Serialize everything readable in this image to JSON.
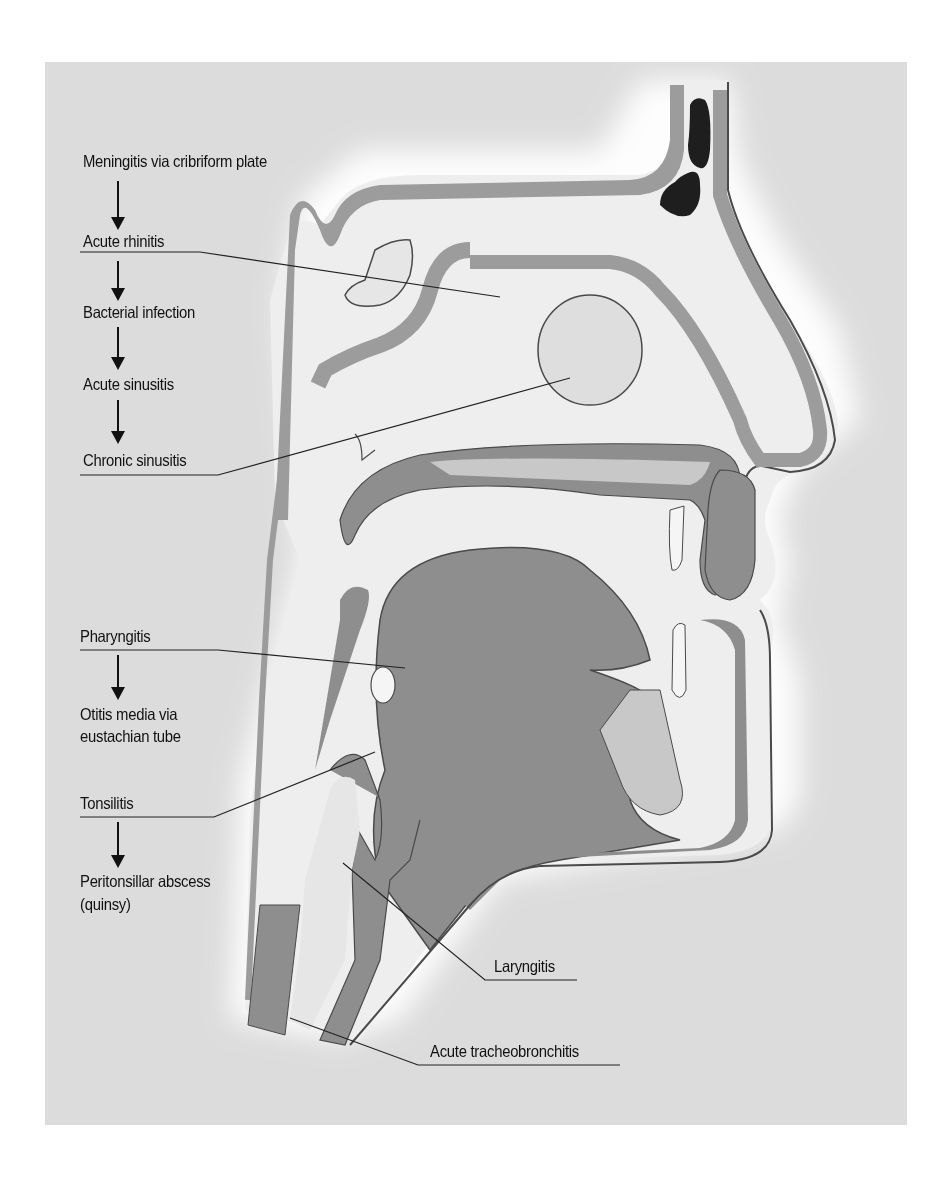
{
  "diagram": {
    "colors": {
      "background_panel": "#dcdcdc",
      "tissue_dark": "#8e8e8e",
      "tissue_light": "#c8c8c8",
      "airway_light": "#efefef",
      "sinus_dark": "#1e1e1e",
      "outline": "#4a4a4a",
      "text": "#111111"
    },
    "labels": {
      "meningitis": "Meningitis via cribriform plate",
      "acute_rhinitis": "Acute rhinitis",
      "bacterial_infection": "Bacterial infection",
      "acute_sinusitis": "Acute sinusitis",
      "chronic_sinusitis": "Chronic sinusitis",
      "pharyngitis": "Pharyngitis",
      "otitis_line1": "Otitis media via",
      "otitis_line2": "eustachian tube",
      "tonsilitis": "Tonsilitis",
      "peritonsillar_line1": "Peritonsillar abscess",
      "peritonsillar_line2": "(quinsy)",
      "laryngitis": "Laryngitis",
      "tracheobronchitis": "Acute tracheobronchitis"
    },
    "flow_sequences": [
      [
        "Meningitis via cribriform plate",
        "Acute rhinitis",
        "Bacterial infection",
        "Acute sinusitis",
        "Chronic sinusitis"
      ],
      [
        "Pharyngitis",
        "Otitis media via eustachian tube"
      ],
      [
        "Tonsilitis",
        "Peritonsillar abscess (quinsy)"
      ]
    ],
    "pointers": [
      {
        "label": "Acute rhinitis",
        "target": "nasal cavity"
      },
      {
        "label": "Chronic sinusitis",
        "target": "maxillary sinus"
      },
      {
        "label": "Pharyngitis",
        "target": "pharynx"
      },
      {
        "label": "Tonsilitis",
        "target": "tonsil"
      },
      {
        "label": "Laryngitis",
        "target": "larynx"
      },
      {
        "label": "Acute tracheobronchitis",
        "target": "trachea"
      }
    ]
  }
}
